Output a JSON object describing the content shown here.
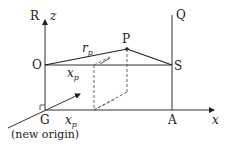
{
  "diagram": {
    "points": {
      "R": "R",
      "Q": "Q",
      "P": "P",
      "O": "O",
      "S": "S",
      "G": "G",
      "A": "A"
    },
    "axes": {
      "z": "z",
      "x": "x"
    },
    "labels": {
      "rp_main": "r",
      "rp_sub": "p",
      "xp_top_main": "x",
      "xp_top_sub": "p",
      "xp_bottom_main": "x",
      "xp_bottom_sub": "p",
      "new_origin": "(new origin)"
    },
    "colors": {
      "line": "#333333",
      "dashed": "#555555"
    }
  }
}
